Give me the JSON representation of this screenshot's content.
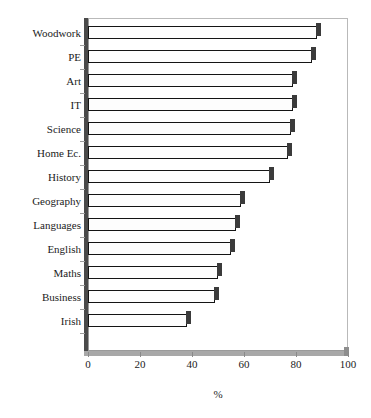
{
  "chart_data": {
    "type": "bar",
    "orientation": "horizontal",
    "title": "",
    "xlabel": "%",
    "ylabel": "",
    "categories": [
      "Woodwork",
      "PE",
      "Art",
      "IT",
      "Science",
      "Home Ec.",
      "History",
      "Geography",
      "Languages",
      "English",
      "Maths",
      "Business",
      "Irish"
    ],
    "values": [
      88,
      86,
      79,
      79,
      78,
      77,
      70,
      59,
      57,
      55,
      50,
      49,
      38
    ],
    "xlim": [
      0,
      100
    ],
    "xticks": [
      0,
      20,
      40,
      60,
      80,
      100
    ],
    "xtick_labels": [
      "0",
      "20",
      "40",
      "60",
      "80",
      "100"
    ],
    "grid": false,
    "legend": null,
    "bar_fill_color": "#fdfdfd",
    "bar_edge_color": "#141414",
    "bar_shadow_color": "#3b3b3b",
    "axis_color": "#9a9a9a",
    "axis_shadow_color": "#4a4a4a",
    "background_color": "#ffffff"
  },
  "axis": {
    "x_title": "%"
  }
}
